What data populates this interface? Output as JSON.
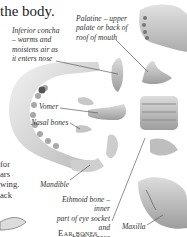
{
  "page": {
    "heading": "the body.",
    "body_text_lines": [
      "for",
      "ars",
      "wing.",
      "ack"
    ],
    "section_heading": "Ear bones"
  },
  "labels": [
    {
      "id": "inferior-concha",
      "lines": [
        "Inferior concha",
        "– warms and",
        "moistens air as",
        "it enters nose"
      ]
    },
    {
      "id": "palatine",
      "lines": [
        "Palatine – upper",
        "palate or back of",
        "roof of mouth"
      ]
    },
    {
      "id": "vomer",
      "lines": [
        "Vomer"
      ]
    },
    {
      "id": "nasal-bones",
      "lines": [
        "Nasal bones"
      ]
    },
    {
      "id": "mandible",
      "lines": [
        "Mandible"
      ]
    },
    {
      "id": "ethmoid",
      "lines": [
        "Ethmoid bone – inner",
        "part of eye socket and",
        "back of nose"
      ]
    },
    {
      "id": "maxilla",
      "lines": [
        "Maxilla"
      ]
    }
  ],
  "colors": {
    "bone_light": "#e6e6e6",
    "bone_mid": "#bdbdbd",
    "bone_dark": "#8a8a8a",
    "leader_line": "#444444"
  }
}
